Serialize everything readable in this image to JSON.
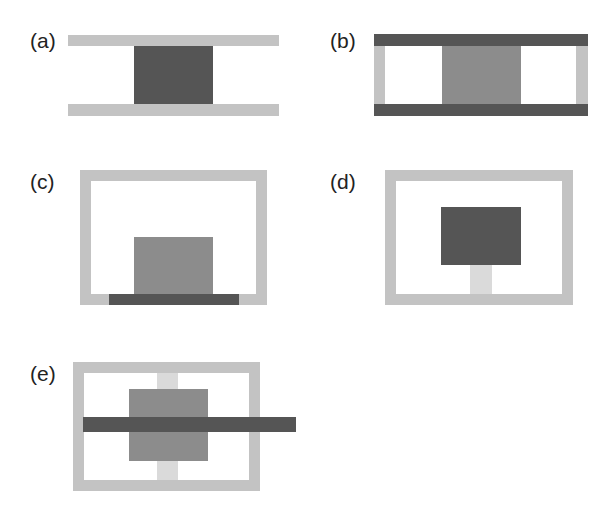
{
  "figure": {
    "panels": [
      {
        "id": "a",
        "label": "(a)"
      },
      {
        "id": "b",
        "label": "(b)"
      },
      {
        "id": "c",
        "label": "(c)"
      },
      {
        "id": "d",
        "label": "(d)"
      },
      {
        "id": "e",
        "label": "(e)"
      }
    ],
    "colors": {
      "light_gray": "#c3c3c3",
      "lighter_gray": "#dadada",
      "mid_gray": "#8c8c8c",
      "dark_gray": "#555555",
      "label": "#222222"
    }
  }
}
